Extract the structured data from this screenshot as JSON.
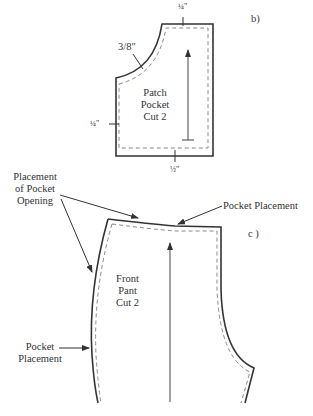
{
  "figure_b": {
    "panel_label": "b)",
    "seam_top": "¼\"",
    "seam_curve": "3/8\"",
    "seam_left": "¼\"",
    "seam_bottom": "½\"",
    "piece_name_line1": "Patch",
    "piece_name_line2": "Pocket",
    "piece_name_line3": "Cut 2"
  },
  "figure_c": {
    "panel_label": "c )",
    "callout_opening_line1": "Placement",
    "callout_opening_line2": "of Pocket",
    "callout_opening_line3": "Opening",
    "callout_top": "Pocket Placement",
    "callout_side_line1": "Pocket",
    "callout_side_line2": "Placement",
    "piece_name_line1": "Front",
    "piece_name_line2": "Pant",
    "piece_name_line3": "Cut 2"
  },
  "colors": {
    "cut_line": "#333333",
    "seam_line": "#777777",
    "text": "#333333"
  }
}
